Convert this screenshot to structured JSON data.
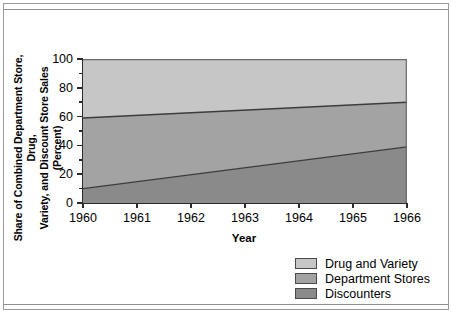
{
  "figure": {
    "ylabel": "Share of Combined Department Store, Drug,\nVariety, and Discount Store Sales (Percent)",
    "xlabel": "Year"
  },
  "axes": {
    "y_tick_labels": [
      "100",
      "80",
      "60",
      "40",
      "20",
      "0"
    ],
    "x_tick_labels": [
      "1960",
      "1961",
      "1962",
      "1963",
      "1964",
      "1965",
      "1966"
    ]
  },
  "legend": {
    "items": [
      {
        "label": "Drug and Variety",
        "color": "#c6c6c6"
      },
      {
        "label": "Department Stores",
        "color": "#a3a3a3"
      },
      {
        "label": "Discounters",
        "color": "#8a8a8a"
      }
    ]
  },
  "colors": {
    "drug_and_variety": "#c6c6c6",
    "department_stores": "#a3a3a3",
    "discounters": "#8a8a8a",
    "axis": "#2b2b2b",
    "frame": "#9a9a9a",
    "band_edge": "#3c3c3c"
  },
  "chart_data": {
    "type": "area",
    "stacked": true,
    "title": "",
    "subtitle": "",
    "xlabel": "Year",
    "ylabel": "Share of Combined Department Store, Drug, Variety, and Discount Store Sales (Percent)",
    "x": [
      1960,
      1961,
      1962,
      1963,
      1964,
      1965,
      1966
    ],
    "xlim": [
      1960,
      1966
    ],
    "ylim": [
      0,
      100
    ],
    "y_major_ticks": [
      0,
      20,
      40,
      60,
      80,
      100
    ],
    "y_minor_ticks": [
      10,
      30,
      50,
      70,
      90
    ],
    "grid": false,
    "legend_position": "bottom-right",
    "series": [
      {
        "name": "Discounters",
        "color": "#8a8a8a",
        "stack_order": 1,
        "values": [
          10,
          14.8,
          19.7,
          24.5,
          29.3,
          34.2,
          39
        ]
      },
      {
        "name": "Department Stores",
        "color": "#a3a3a3",
        "stack_order": 2,
        "values": [
          49,
          46.2,
          43.3,
          40.5,
          37.7,
          34.8,
          31
        ]
      },
      {
        "name": "Drug and Variety",
        "color": "#c6c6c6",
        "stack_order": 3,
        "values": [
          41,
          39,
          37,
          35,
          33,
          31,
          30
        ]
      }
    ],
    "cumulative_boundaries": {
      "discounters_top": [
        10,
        14.8,
        19.7,
        24.5,
        29.3,
        34.2,
        39
      ],
      "department_stores_top": [
        59,
        61,
        63,
        65,
        67,
        68.5,
        70
      ],
      "drug_and_variety_top": [
        100,
        100,
        100,
        100,
        100,
        100,
        100
      ]
    }
  }
}
